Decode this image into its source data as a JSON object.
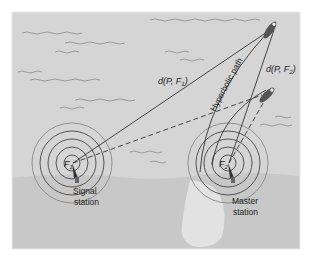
{
  "diagram": {
    "labels": {
      "d_pf1": "d(P, F",
      "d_pf1_sub": "1",
      "d_pf2": "d(P, F",
      "d_pf2_sub": "2",
      "close_paren": ")",
      "hyperbolic_path": "Hyperbolic path",
      "f1": "F",
      "f1_sub": "1",
      "f2": "F",
      "f2_sub": "2",
      "signal_station_line1": "Signal",
      "signal_station_line2": "station",
      "master_station_line1": "Master",
      "master_station_line2": "station"
    },
    "colors": {
      "water": "#d5d5d5",
      "land": "#c6c6c6",
      "line": "#333333",
      "rings": "#444444"
    },
    "nodes": [
      {
        "id": "signal-station",
        "label": "Signal station",
        "focus": "F1"
      },
      {
        "id": "master-station",
        "label": "Master station",
        "focus": "F2"
      },
      {
        "id": "ship-p",
        "label": "P"
      },
      {
        "id": "ship-2",
        "label": "second ship"
      }
    ],
    "edges": [
      {
        "from": "signal-station",
        "to": "ship-p",
        "label": "d(P, F1)",
        "style": "solid"
      },
      {
        "from": "master-station",
        "to": "ship-p",
        "label": "d(P, F2)",
        "style": "solid"
      },
      {
        "from": "signal-station",
        "to": "ship-2",
        "style": "dashed"
      },
      {
        "from": "master-station",
        "to": "ship-2",
        "style": "dashed"
      }
    ]
  }
}
